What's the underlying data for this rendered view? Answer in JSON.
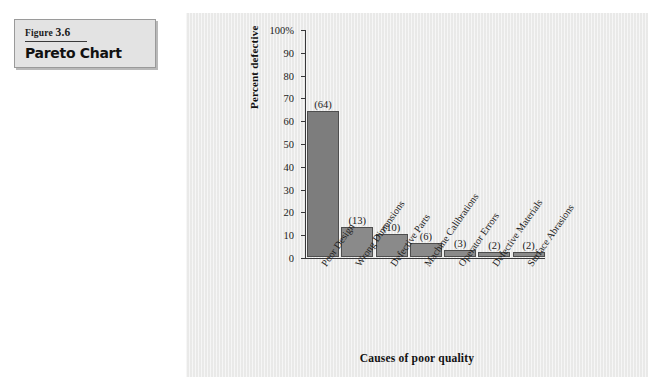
{
  "figure": {
    "label": "Figure",
    "number": "3.6",
    "title": "Pareto Chart"
  },
  "colors": {
    "panel_background": "#ececeb",
    "bar_fill": "#8a8a8a",
    "bar_first_fill": "#7d7d7d",
    "bar_border": "#4e4e4e",
    "axis": "#38383a",
    "caption_box_background": "#e3e3e3",
    "caption_box_border": "#9a9a9a",
    "text": "#1b1b1b"
  },
  "chart_data": {
    "type": "bar",
    "title": "",
    "subtitle": "",
    "xlabel": "Causes of poor quality",
    "ylabel": "Percent defective",
    "ylim": [
      0,
      100
    ],
    "yticks": [
      0,
      10,
      20,
      30,
      40,
      50,
      60,
      70,
      80,
      90,
      100
    ],
    "ytick_labels": [
      "0",
      "10",
      "20",
      "30",
      "40",
      "50",
      "60",
      "70",
      "80",
      "90",
      "100%"
    ],
    "grid": false,
    "legend": false,
    "legend_position": "none",
    "categories": [
      "Poor Design",
      "Wrong Dimensions",
      "Defective Parts",
      "Machine Calibrations",
      "Operator Errors",
      "Defective Materials",
      "Surface Abrasions"
    ],
    "values": [
      64,
      13,
      10,
      6,
      3,
      2,
      2
    ],
    "data_labels": [
      "(64)",
      "(13)",
      "(10)",
      "(6)",
      "(3)",
      "(2)",
      "(2)"
    ]
  }
}
